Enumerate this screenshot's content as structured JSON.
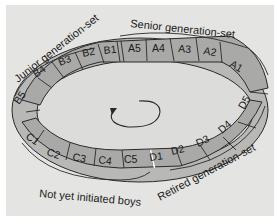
{
  "diagram": {
    "type": "cyclical generation-set ring",
    "colors": {
      "background": "#e4e4e2",
      "ring_fill": "#a9a9a7",
      "ring_side": "#b8b8b6",
      "ring_inner": "#dcdcda",
      "stroke": "#2a2a2a"
    },
    "groups": {
      "senior": {
        "label": "Senior generation-set",
        "segments": [
          "A5",
          "A4",
          "A3",
          "A2",
          "A1"
        ]
      },
      "junior": {
        "label": "Junior generation-set",
        "segments": [
          "B1",
          "B2",
          "B3",
          "B4",
          "B5"
        ]
      },
      "boys": {
        "label": "Not yet initiated boys",
        "segments": [
          "C1",
          "C2",
          "C3",
          "C4",
          "C5"
        ]
      },
      "retired": {
        "label": "Retired generation-set",
        "segments": [
          "D1",
          "D2",
          "D3",
          "D4",
          "D5"
        ]
      }
    },
    "center_arrow": "circular-arrow-icon"
  }
}
